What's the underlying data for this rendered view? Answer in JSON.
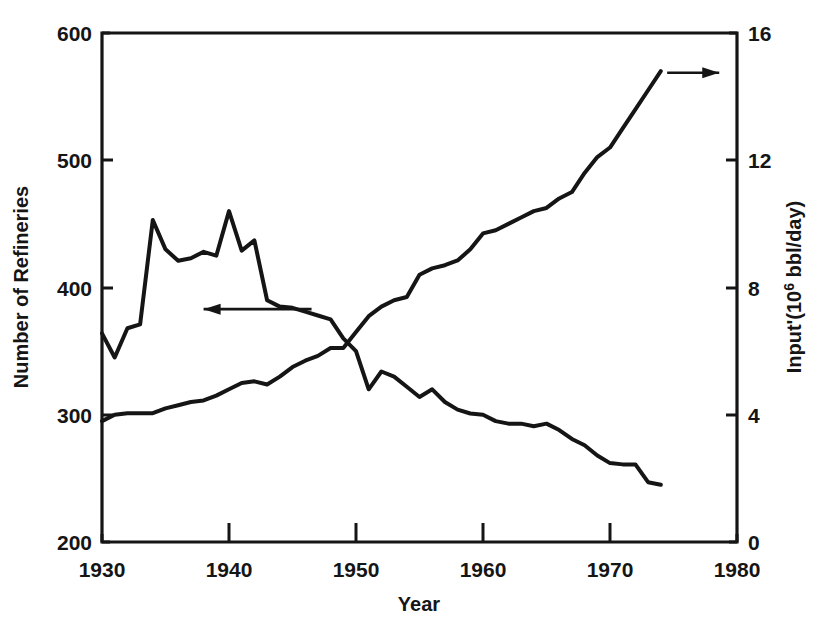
{
  "chart_data": {
    "type": "line",
    "title": "",
    "subtitle": "",
    "xlabel": "Year",
    "ylabel": "Number of Refineries",
    "y2label_prefix": "Input'(10",
    "y2label_sup": "6",
    "y2label_suffix": " bbl/day)",
    "y2label": "Input'(10⁶ bbl/day)",
    "xlim": [
      1930,
      1980
    ],
    "ylim": [
      200,
      600
    ],
    "y2lim": [
      0,
      16
    ],
    "grid": false,
    "legend": "none",
    "xticks": [
      "1930",
      "1940",
      "1950",
      "1960",
      "1970",
      "1980"
    ],
    "xtick_values": [
      1930,
      1940,
      1950,
      1960,
      1970,
      1980
    ],
    "yticks": [
      "200",
      "300",
      "400",
      "500",
      "600"
    ],
    "ytick_values": [
      200,
      300,
      400,
      500,
      600
    ],
    "y2ticks": [
      "0",
      "4",
      "8",
      "12",
      "16"
    ],
    "y2tick_values": [
      0,
      4,
      8,
      12,
      16
    ],
    "annotations": [
      {
        "name": "arrow-to-left-axis",
        "text": "",
        "direction": "left",
        "x_from": 1946.5,
        "x_to": 1938.0,
        "y_value": 383,
        "axis": "left"
      },
      {
        "name": "arrow-to-right-axis",
        "text": "",
        "direction": "right",
        "x_from": 1974.5,
        "x_to": 1978.6,
        "y_value": 14.75,
        "axis": "right"
      }
    ],
    "series": [
      {
        "name": "Number of Refineries",
        "axis": "left",
        "units": "refineries",
        "x": [
          1930,
          1931,
          1932,
          1933,
          1934,
          1935,
          1936,
          1937,
          1938,
          1939,
          1940,
          1941,
          1942,
          1943,
          1944,
          1945,
          1946,
          1947,
          1948,
          1949,
          1950,
          1951,
          1952,
          1953,
          1954,
          1955,
          1956,
          1957,
          1958,
          1959,
          1960,
          1961,
          1962,
          1963,
          1964,
          1965,
          1966,
          1967,
          1968,
          1969,
          1970,
          1971,
          1972,
          1973,
          1974
        ],
        "values": [
          364,
          345,
          368,
          371,
          453,
          430,
          421,
          423,
          428,
          425,
          460,
          429,
          437,
          390,
          385,
          384,
          381,
          378,
          375,
          360,
          350,
          320,
          334,
          330,
          322,
          314,
          320,
          310,
          304,
          301,
          300,
          295,
          293,
          293,
          291,
          293,
          288,
          281,
          276,
          268,
          262,
          261,
          261,
          247,
          245
        ],
        "note": "Solid descending/peaked curve plotted against the left axis"
      },
      {
        "name": "Input",
        "axis": "right",
        "units": "10^6 bbl/day",
        "x": [
          1930,
          1931,
          1932,
          1933,
          1934,
          1935,
          1936,
          1937,
          1938,
          1939,
          1940,
          1941,
          1942,
          1943,
          1944,
          1945,
          1946,
          1947,
          1948,
          1949,
          1950,
          1951,
          1952,
          1953,
          1954,
          1955,
          1956,
          1957,
          1958,
          1959,
          1960,
          1961,
          1962,
          1963,
          1964,
          1965,
          1966,
          1967,
          1968,
          1969,
          1970,
          1971,
          1972,
          1973,
          1974
        ],
        "values": [
          3.8,
          4.0,
          4.05,
          4.05,
          4.05,
          4.2,
          4.3,
          4.4,
          4.45,
          4.6,
          4.8,
          5.0,
          5.05,
          4.95,
          5.2,
          5.5,
          5.7,
          5.85,
          6.1,
          6.1,
          6.6,
          7.1,
          7.4,
          7.6,
          7.7,
          8.4,
          8.6,
          8.7,
          8.85,
          9.2,
          9.7,
          9.8,
          10.0,
          10.2,
          10.4,
          10.5,
          10.8,
          11.0,
          11.6,
          12.1,
          12.4,
          13.0,
          13.6,
          14.2,
          14.8
        ],
        "note": "Solid rising curve plotted against the right axis; small gap in the stroke near 1959"
      }
    ]
  },
  "figure": {
    "background_color": "#ffffff",
    "line_color": "#151515",
    "width": 829,
    "height": 622
  }
}
